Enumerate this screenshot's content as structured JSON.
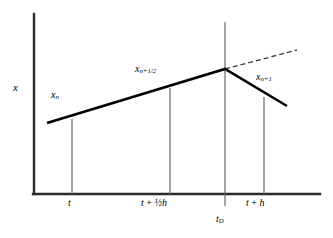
{
  "figure": {
    "type": "diagram",
    "background_color": "#ffffff",
    "line_color": "#000000"
  },
  "axes": {
    "y_label": "x",
    "x_label": "",
    "y_axis": {
      "x": 34,
      "y_top": 14,
      "y_bottom": 194,
      "width": 2.2
    },
    "x_axis": {
      "y": 194,
      "x_left": 34,
      "x_right": 320,
      "width": 2.2
    },
    "ticks": [
      {
        "name": "t",
        "x": 72,
        "label": "t",
        "label_parts": {
          "base": "t",
          "op": "",
          "frac": "",
          "tail": ""
        }
      },
      {
        "name": "t-half-h",
        "x": 170,
        "label": "t + ½h",
        "label_parts": {
          "base": "t",
          "op": " + ",
          "frac": "½",
          "tail": "h"
        }
      },
      {
        "name": "t-plus-h",
        "x": 264,
        "label": "t + h",
        "label_parts": {
          "base": "t",
          "op": " + ",
          "frac": "",
          "tail": "h"
        }
      }
    ],
    "special_tick": {
      "name": "t-D",
      "x": 225,
      "label": "tD",
      "base": "t",
      "subscript": "D",
      "line_y_top": 22,
      "line_y_bottom": 206
    }
  },
  "curve_labels": [
    {
      "name": "x-n",
      "base": "x",
      "subscript": "n",
      "text": "xn"
    },
    {
      "name": "x-n-half",
      "base": "x",
      "subscript": "n+1/2",
      "text": "xn+1/2"
    },
    {
      "name": "x-n-plus-1",
      "base": "x",
      "subscript": "n+1",
      "text": "xn+1"
    }
  ],
  "chart_data": {
    "type": "line",
    "title": "",
    "xlabel": "",
    "ylabel": "x",
    "series": [
      {
        "name": "trajectory-solid",
        "style": "solid",
        "width": 2.6,
        "points": [
          [
            47,
            123
          ],
          [
            225,
            69
          ],
          [
            287,
            106
          ]
        ]
      },
      {
        "name": "extrapolation-dashed",
        "style": "dashed",
        "width": 1.3,
        "dash": "5,3",
        "points": [
          [
            225,
            69
          ],
          [
            297,
            50
          ]
        ]
      }
    ],
    "drop_lines": [
      {
        "name": "drop-line-t",
        "x": 72,
        "y_top": 119,
        "y_bottom": 194
      },
      {
        "name": "drop-line-t-half-h",
        "x": 170,
        "y_top": 88,
        "y_bottom": 194
      },
      {
        "name": "drop-line-t-plus-h",
        "x": 264,
        "y_top": 97,
        "y_bottom": 194
      }
    ],
    "grid": false,
    "legend": "none"
  }
}
